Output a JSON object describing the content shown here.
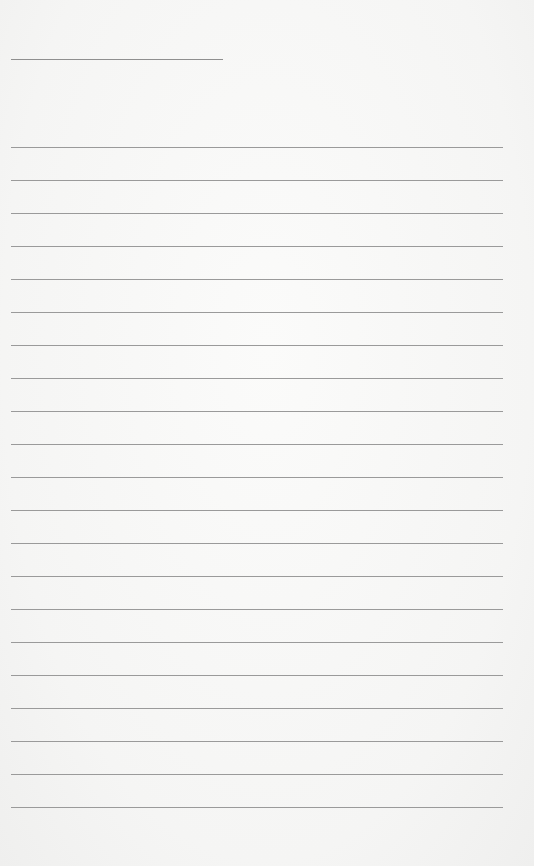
{
  "document": {
    "type": "lined paper",
    "header_line": {
      "x": 11,
      "y": 59,
      "width": 212
    },
    "rules": {
      "count": 21,
      "start_y": 147,
      "spacing": 33,
      "x": 11,
      "width": 492
    },
    "colors": {
      "paper": "#f7f7f6",
      "line": "#9a9a9a"
    },
    "text": ""
  }
}
